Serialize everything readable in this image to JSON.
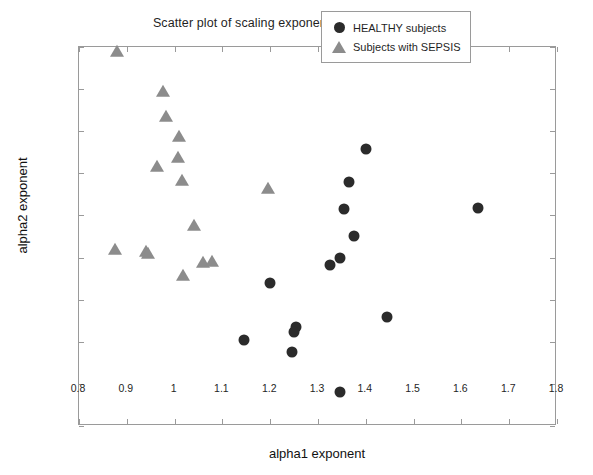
{
  "chart_data": {
    "type": "scatter",
    "title": "Scatter plot of scaling exponents alpha1 vs. alpha2",
    "xlabel": "alpha1 exponent",
    "ylabel": "alpha2 exponent",
    "xlim": [
      0.8,
      1.8
    ],
    "ylim": [
      1.0,
      1.45
    ],
    "xticks": [
      "0.8",
      "0.9",
      "1",
      "1.1",
      "1.2",
      "1.3",
      "1.4",
      "1.5",
      "1.6",
      "1.7",
      "1.8"
    ],
    "xtick_values": [
      0.8,
      0.9,
      1.0,
      1.1,
      1.2,
      1.3,
      1.4,
      1.5,
      1.6,
      1.7,
      1.8
    ],
    "yticks": [
      "1",
      "1.05",
      "1.1",
      "1.15",
      "1.2",
      "1.25",
      "1.3",
      "1.35",
      "1.4",
      "1.45"
    ],
    "ytick_values": [
      1.0,
      1.05,
      1.1,
      1.15,
      1.2,
      1.25,
      1.3,
      1.35,
      1.4,
      1.45
    ],
    "grid": false,
    "legend_position": "top-right",
    "series": [
      {
        "name": "HEALTHY subjects",
        "marker": "circle",
        "color": "#2b2b2b",
        "points": [
          [
            1.4,
            1.329
          ],
          [
            1.365,
            1.29
          ],
          [
            1.355,
            1.258
          ],
          [
            1.375,
            1.226
          ],
          [
            1.325,
            1.191
          ],
          [
            1.345,
            1.2
          ],
          [
            1.2,
            1.17
          ],
          [
            1.145,
            1.102
          ],
          [
            1.255,
            1.118
          ],
          [
            1.25,
            1.112
          ],
          [
            1.245,
            1.088
          ],
          [
            1.445,
            1.129
          ],
          [
            1.635,
            1.259
          ],
          [
            1.345,
            1.04
          ]
        ]
      },
      {
        "name": "Subjects with SEPSIS",
        "marker": "triangle",
        "color": "#8c8c8c",
        "points": [
          [
            0.88,
            1.444
          ],
          [
            0.975,
            1.397
          ],
          [
            0.983,
            1.367
          ],
          [
            1.01,
            1.343
          ],
          [
            1.008,
            1.318
          ],
          [
            0.963,
            1.307
          ],
          [
            1.015,
            1.291
          ],
          [
            1.195,
            1.281
          ],
          [
            1.04,
            1.237
          ],
          [
            0.875,
            1.209
          ],
          [
            0.94,
            1.207
          ],
          [
            0.945,
            1.204
          ],
          [
            1.06,
            1.194
          ],
          [
            1.078,
            1.195
          ],
          [
            1.018,
            1.178
          ]
        ]
      }
    ]
  },
  "legend": {
    "entries": [
      {
        "label": "HEALTHY subjects",
        "marker": "circle-marker"
      },
      {
        "label": "Subjects with SEPSIS",
        "marker": "triangle-marker"
      }
    ]
  }
}
